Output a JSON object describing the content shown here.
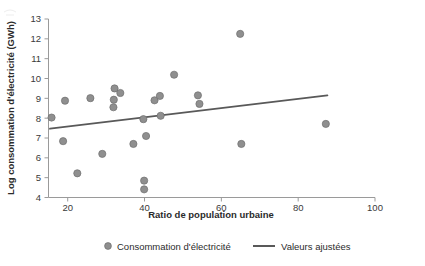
{
  "chart_data": {
    "type": "scatter",
    "title": "",
    "xlabel": "Ratio de population urbaine",
    "ylabel": "Log consommation d'électricité (GWh)",
    "xlim": [
      15,
      100
    ],
    "ylim": [
      4,
      13
    ],
    "xticks": [
      20,
      40,
      60,
      80,
      100
    ],
    "yticks": [
      4,
      5,
      6,
      7,
      8,
      9,
      10,
      11,
      12,
      13
    ],
    "grid": false,
    "legend_position": "bottom",
    "series": [
      {
        "name": "Consommation d'électricité",
        "type": "scatter",
        "color": "#8f8f8f",
        "marker": "circle",
        "points": [
          {
            "x": 15.8,
            "y": 8.03
          },
          {
            "x": 18.8,
            "y": 6.84
          },
          {
            "x": 19.3,
            "y": 8.88
          },
          {
            "x": 22.5,
            "y": 5.22
          },
          {
            "x": 25.9,
            "y": 9.01
          },
          {
            "x": 29.0,
            "y": 6.2
          },
          {
            "x": 31.9,
            "y": 8.55
          },
          {
            "x": 32.0,
            "y": 8.93
          },
          {
            "x": 32.2,
            "y": 9.5
          },
          {
            "x": 33.7,
            "y": 9.27
          },
          {
            "x": 37.1,
            "y": 6.7
          },
          {
            "x": 39.7,
            "y": 7.95
          },
          {
            "x": 39.9,
            "y": 4.85
          },
          {
            "x": 39.9,
            "y": 4.41
          },
          {
            "x": 40.4,
            "y": 7.1
          },
          {
            "x": 42.6,
            "y": 8.9
          },
          {
            "x": 44.0,
            "y": 9.12
          },
          {
            "x": 44.2,
            "y": 8.12
          },
          {
            "x": 47.7,
            "y": 10.19
          },
          {
            "x": 53.9,
            "y": 9.15
          },
          {
            "x": 54.3,
            "y": 8.72
          },
          {
            "x": 64.9,
            "y": 12.25
          },
          {
            "x": 65.2,
            "y": 6.7
          },
          {
            "x": 87.2,
            "y": 7.71
          }
        ]
      },
      {
        "name": "Valeurs ajustées",
        "type": "line",
        "color": "#595959",
        "points": [
          {
            "x": 15.4,
            "y": 7.47
          },
          {
            "x": 87.6,
            "y": 9.15
          }
        ]
      }
    ]
  },
  "legend": {
    "items": [
      {
        "label": "Consommation d'électricité",
        "marker": "circle",
        "color": "#8f8f8f"
      },
      {
        "label": "Valeurs ajustées",
        "marker": "line",
        "color": "#595959"
      }
    ]
  },
  "axes": {
    "x": {
      "title": "Ratio de population urbaine",
      "tick_labels": [
        "20",
        "40",
        "60",
        "80",
        "100"
      ]
    },
    "y": {
      "title": "Log consommation d'électricité (GWh)",
      "tick_labels": [
        "4",
        "5",
        "6",
        "7",
        "8",
        "9",
        "10",
        "11",
        "12",
        "13"
      ]
    }
  }
}
